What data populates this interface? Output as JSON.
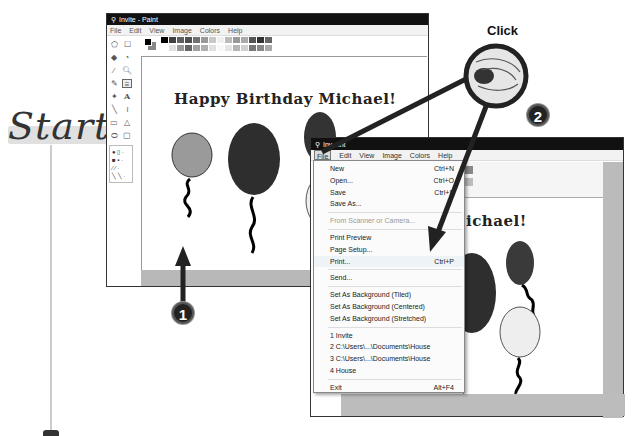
{
  "start_label": "Start",
  "click_label": "Click",
  "steps": [
    {
      "number": "1"
    },
    {
      "number": "2"
    }
  ],
  "window1": {
    "title": "Invite - Paint",
    "menus": [
      "File",
      "Edit",
      "View",
      "Image",
      "Colors",
      "Help"
    ],
    "canvas_text": "Happy Birthday Michael!",
    "tools": [
      [
        "free-select",
        "rect-select"
      ],
      [
        "eraser",
        "fill"
      ],
      [
        "pick-color",
        "magnifier"
      ],
      [
        "pencil",
        "brush"
      ],
      [
        "airbrush",
        "text"
      ],
      [
        "line",
        "curve"
      ],
      [
        "rectangle",
        "polygon"
      ],
      [
        "ellipse",
        "rounded-rect"
      ]
    ],
    "palette_top": [
      "#000000",
      "#404040",
      "#606060",
      "#505050",
      "#707070",
      "#999999",
      "#c8c8c8",
      "#f0f0f0",
      "#bbbbbb",
      "#999999",
      "#aaaaaa",
      "#555555",
      "#333333",
      "#666666"
    ],
    "palette_bottom": [
      "#ffffff",
      "#e0e0e0",
      "#999999",
      "#666666",
      "#a0a0a0",
      "#b0b0b0",
      "#e0e0e0",
      "#f8f8f8",
      "#e5e5e5",
      "#b5b5b5",
      "#d0d0d0",
      "#777777",
      "#888888",
      "#aaaaaa"
    ]
  },
  "window2": {
    "title": "Invite - Paint",
    "title_visible": "Inv     aint",
    "menus": [
      "File",
      "Edit",
      "View",
      "Image",
      "Colors",
      "Help"
    ],
    "canvas_text": "ichael!"
  },
  "file_menu": {
    "items": [
      {
        "label": "New",
        "shortcut": "Ctrl+N"
      },
      {
        "label": "Open...",
        "shortcut": "Ctrl+O"
      },
      {
        "label": "Save",
        "shortcut": "Ctrl+S"
      },
      {
        "label": "Save As...",
        "shortcut": ""
      },
      {
        "sep": true
      },
      {
        "label": "From Scanner or Camera...",
        "shortcut": "",
        "disabled": true
      },
      {
        "sep": true
      },
      {
        "label": "Print Preview",
        "shortcut": ""
      },
      {
        "label": "Page Setup...",
        "shortcut": ""
      },
      {
        "label": "Print...",
        "shortcut": "Ctrl+P",
        "highlighted": true
      },
      {
        "sep": true
      },
      {
        "label": "Send...",
        "shortcut": ""
      },
      {
        "sep": true
      },
      {
        "label": "Set As Background (Tiled)",
        "shortcut": ""
      },
      {
        "label": "Set As Background (Centered)",
        "shortcut": ""
      },
      {
        "label": "Set As Background (Stretched)",
        "shortcut": ""
      },
      {
        "sep": true
      },
      {
        "label": "1 Invite",
        "shortcut": ""
      },
      {
        "label": "2 C:\\Users\\...\\Documents\\House",
        "shortcut": ""
      },
      {
        "label": "3 C:\\Users\\...\\Documents\\House",
        "shortcut": ""
      },
      {
        "label": "4 House",
        "shortcut": ""
      },
      {
        "sep": true
      },
      {
        "label": "Exit",
        "shortcut": "Alt+F4"
      }
    ]
  },
  "colors": {
    "titlebar": "#111111",
    "balloon_light": "#9a9a9a",
    "balloon_dark": "#2e2e2e",
    "balloon_pale": "#e8e8e8",
    "canvas_border": "#b8b8b8"
  }
}
